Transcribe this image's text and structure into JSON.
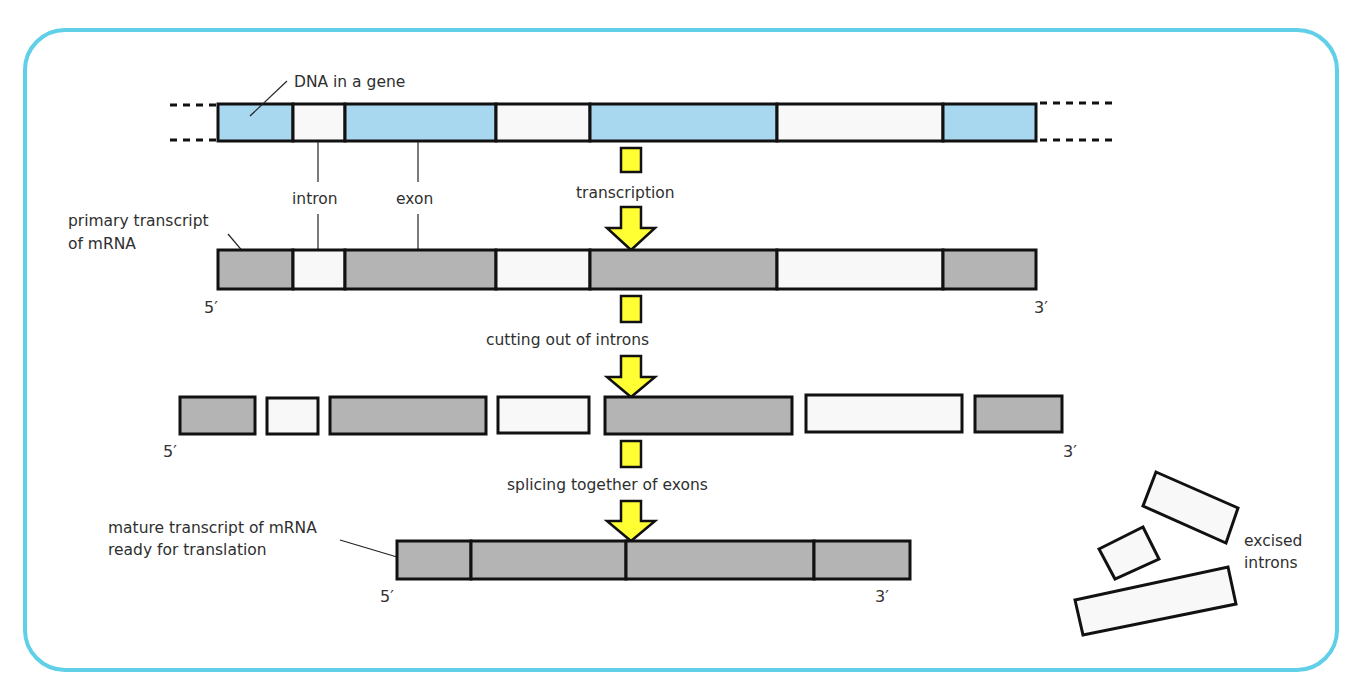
{
  "colors": {
    "border": "#5fd0e8",
    "exon_dna": "#a8d8f0",
    "intron": "#f8f8f8",
    "exon_rna": "#b4b4b4",
    "arrow": "#ffff33",
    "outline": "#111111"
  },
  "labels": {
    "dna_gene": "DNA in a gene",
    "intron": "intron",
    "exon": "exon",
    "transcription": "transcription",
    "primary_line1": "primary transcript",
    "primary_line2": "of mRNA",
    "cutting": "cutting out of introns",
    "splicing": "splicing together of exons",
    "mature_line1": "mature transcript of mRNA",
    "mature_line2": "ready for translation",
    "excised_line1": "excised",
    "excised_line2": "introns",
    "five_prime": "5′",
    "three_prime": "3′"
  },
  "rows": {
    "dna": {
      "y": 104,
      "h": 37,
      "segments": [
        {
          "x": 218,
          "w": 75,
          "type": "exon"
        },
        {
          "x": 293,
          "w": 52,
          "type": "intron"
        },
        {
          "x": 345,
          "w": 151,
          "type": "exon"
        },
        {
          "x": 496,
          "w": 94,
          "type": "intron"
        },
        {
          "x": 590,
          "w": 187,
          "type": "exon"
        },
        {
          "x": 777,
          "w": 166,
          "type": "intron"
        },
        {
          "x": 943,
          "w": 93,
          "type": "exon"
        }
      ]
    },
    "primary": {
      "y": 250,
      "h": 39
    },
    "cut": {
      "y": 397,
      "h": 37,
      "segments": [
        {
          "x": 180,
          "w": 75,
          "type": "exon"
        },
        {
          "x": 266,
          "w": 52,
          "type": "intron"
        },
        {
          "x": 330,
          "w": 156,
          "type": "exon"
        },
        {
          "x": 498,
          "w": 91,
          "type": "intron"
        },
        {
          "x": 605,
          "w": 187,
          "type": "exon"
        },
        {
          "x": 806,
          "w": 156,
          "type": "intron"
        },
        {
          "x": 975,
          "w": 87,
          "type": "exon"
        }
      ]
    },
    "mature": {
      "y": 541,
      "h": 38,
      "segments": [
        {
          "x": 397,
          "w": 74
        },
        {
          "x": 471,
          "w": 155
        },
        {
          "x": 626,
          "w": 188
        },
        {
          "x": 814,
          "w": 96
        }
      ]
    }
  }
}
